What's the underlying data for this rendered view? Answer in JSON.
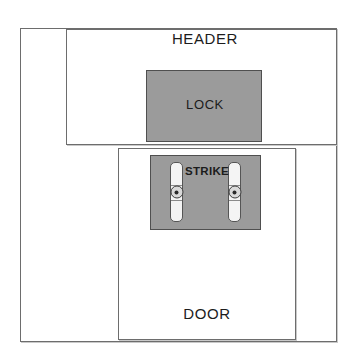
{
  "diagram": {
    "background_color": "#ffffff",
    "line_color": "#6d6d6d",
    "fill_color": "#9b9b9b",
    "text_color": "#1c1c1c"
  },
  "frame": {
    "name": "outer-frame",
    "x": 20,
    "y": 28,
    "width": 317,
    "height": 314
  },
  "header": {
    "label": "HEADER",
    "x": 66,
    "y": 29,
    "width": 271,
    "height": 116,
    "label_x": 205,
    "label_y": 30
  },
  "door": {
    "label": "DOOR",
    "x": 118,
    "y": 148,
    "width": 178,
    "height": 192,
    "label_x": 207,
    "label_y": 305
  },
  "lock": {
    "label": "LOCK",
    "x": 146,
    "y": 70,
    "width": 116,
    "height": 72,
    "label_x": 205,
    "label_y": 97,
    "fill": "#9b9b9b"
  },
  "strike": {
    "label": "STRIKE",
    "x": 150,
    "y": 155,
    "width": 111,
    "height": 75,
    "label_x": 207,
    "label_y": 165,
    "fill": "#9b9b9b",
    "plates": [
      {
        "name": "strike-screw-plate-left",
        "x": 170,
        "y": 162,
        "width": 13,
        "height": 60
      },
      {
        "name": "strike-screw-plate-right",
        "x": 228,
        "y": 162,
        "width": 13,
        "height": 60
      }
    ]
  }
}
